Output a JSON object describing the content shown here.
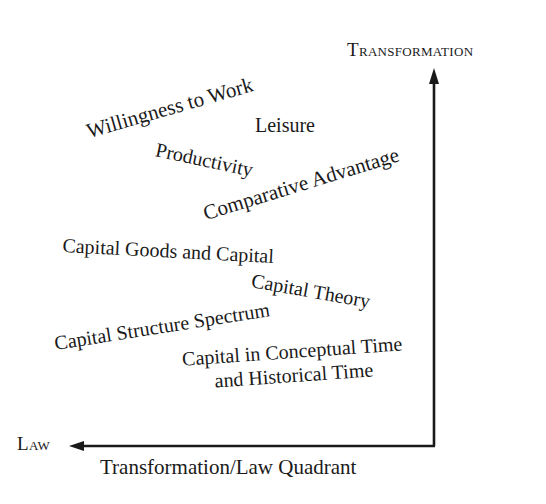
{
  "diagram": {
    "caption": "Transformation/Law Quadrant",
    "axes": {
      "vertical": {
        "label": "Transformation",
        "direction": "up"
      },
      "horizontal": {
        "label": "Law",
        "direction": "left"
      }
    },
    "concepts": [
      {
        "id": "willingness-to-work",
        "text": "Willingness to Work",
        "rotation_deg": -16
      },
      {
        "id": "leisure",
        "text": "Leisure",
        "rotation_deg": 0
      },
      {
        "id": "productivity",
        "text": "Productivity",
        "rotation_deg": 12
      },
      {
        "id": "comparative-advantage",
        "text": "Comparative Advantage",
        "rotation_deg": -17
      },
      {
        "id": "capital-goods-and-capital",
        "text": "Capital Goods and Capital",
        "rotation_deg": 3
      },
      {
        "id": "capital-theory",
        "text": "Capital Theory",
        "rotation_deg": 10
      },
      {
        "id": "capital-structure-spectrum",
        "text": "Capital Structure Spectrum",
        "rotation_deg": -9
      },
      {
        "id": "capital-in-time",
        "lines": [
          "Capital in Conceptual Time",
          "and Historical Time"
        ],
        "rotation_deg": -4
      }
    ],
    "colors": {
      "ink": "#1a1a1a",
      "background": "#ffffff"
    }
  }
}
